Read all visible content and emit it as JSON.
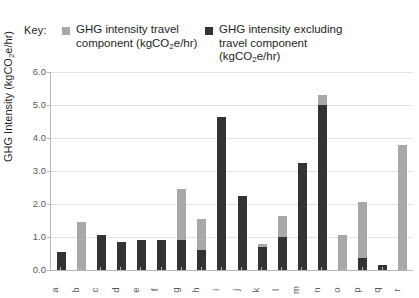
{
  "legend": {
    "key_label": "Key:",
    "entries": [
      {
        "label_line1": "GHG intensity travel",
        "label_line2": "component (kgCO",
        "label_sub": "2",
        "label_line3": "e/hr)",
        "color": "#a8a8a8",
        "swatch_icon": "square-swatch-icon"
      },
      {
        "label_line1": "GHG intensity excluding",
        "label_line2": "travel component",
        "label_line3": "(kgCO",
        "label_sub": "2",
        "label_line4": "e/hr)",
        "color": "#333333",
        "swatch_icon": "square-swatch-icon"
      }
    ]
  },
  "axis": {
    "y_title_pre": "GHG Intensity (kgCO",
    "y_title_sub": "2",
    "y_title_post": "e/hr)",
    "y_ticks": [
      "6.0",
      "5.0",
      "4.0",
      "3.0",
      "2.0",
      "1.0",
      "0.0"
    ]
  },
  "chart_data": {
    "type": "bar",
    "subtype": "stacked",
    "title": "",
    "xlabel": "",
    "ylabel": "GHG Intensity (kgCO2e/hr)",
    "ylim": [
      0,
      6.0
    ],
    "ytick_step": 1.0,
    "grid": true,
    "legend_position": "top",
    "categories": [
      "a",
      "b",
      "c",
      "d",
      "e",
      "f",
      "g",
      "h",
      "i",
      "j",
      "k",
      "l",
      "m",
      "n",
      "o",
      "p",
      "q",
      "r"
    ],
    "series": [
      {
        "name": "GHG intensity excluding travel component (kgCO2e/hr)",
        "color": "#333333",
        "values": [
          0.55,
          0.0,
          1.05,
          0.85,
          0.9,
          0.9,
          0.9,
          0.6,
          4.65,
          2.25,
          0.7,
          1.0,
          3.25,
          5.0,
          0.0,
          0.35,
          0.15,
          0.0
        ]
      },
      {
        "name": "GHG intensity travel component (kgCO2e/hr)",
        "color": "#a8a8a8",
        "values": [
          0.0,
          1.45,
          0.0,
          0.0,
          0.0,
          0.0,
          1.55,
          0.95,
          0.0,
          0.0,
          0.08,
          0.65,
          0.0,
          0.3,
          1.05,
          1.7,
          0.0,
          3.8
        ]
      }
    ],
    "totals": [
      0.55,
      1.45,
      1.05,
      0.85,
      0.9,
      0.9,
      2.45,
      1.55,
      4.65,
      2.25,
      0.78,
      1.65,
      3.25,
      5.3,
      1.05,
      2.05,
      0.15,
      3.8
    ]
  }
}
